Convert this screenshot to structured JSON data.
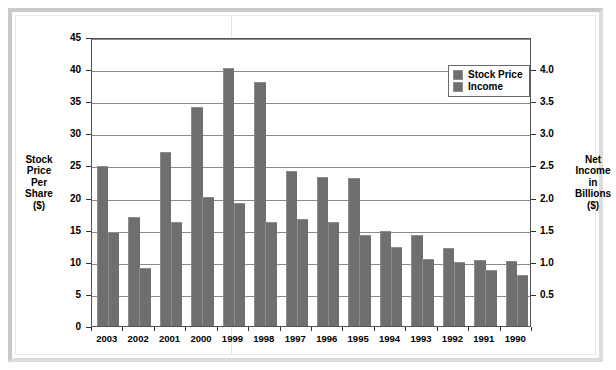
{
  "chart_data": {
    "type": "bar",
    "title": "",
    "categories": [
      "2003",
      "2002",
      "2001",
      "2000",
      "1999",
      "1998",
      "1997",
      "1996",
      "1995",
      "1994",
      "1993",
      "1992",
      "1991",
      "1990"
    ],
    "series": [
      {
        "name": "Stock Price",
        "axis": "left",
        "values": [
          24.7,
          16.8,
          26.9,
          33.9,
          40.0,
          37.8,
          24.0,
          23.0,
          22.9,
          14.7,
          14.0,
          12.0,
          10.1,
          9.9
        ]
      },
      {
        "name": "Income",
        "axis": "right",
        "values": [
          1.45,
          0.89,
          1.6,
          2.0,
          1.9,
          1.6,
          1.65,
          1.6,
          1.4,
          1.22,
          1.03,
          0.98,
          0.86,
          0.78
        ]
      }
    ],
    "left_axis": {
      "label": "Stock Price Per Share ($)",
      "label_lines": [
        "Stock",
        "Price",
        "Per",
        "Share",
        "($)"
      ],
      "ticks": [
        "0",
        "5",
        "10",
        "15",
        "20",
        "25",
        "30",
        "35",
        "40",
        "45"
      ],
      "min": 0,
      "max": 45,
      "step": 5
    },
    "right_axis": {
      "label": "Net Income in Billions ($)",
      "label_lines": [
        "Net",
        "Income",
        "in",
        "Billions",
        "($)"
      ],
      "ticks": [
        "0.5",
        "1.0",
        "1.5",
        "2.0",
        "2.5",
        "3.0",
        "3.5",
        "4.0"
      ],
      "min": 0,
      "max": 4.5,
      "step": 0.5
    },
    "legend": {
      "position": "top-right",
      "entries": [
        {
          "label": "Stock Price",
          "color": "#6f6f6f"
        },
        {
          "label": "Income",
          "color": "#6f6f6f"
        }
      ]
    },
    "grid": true,
    "colors": {
      "bar": "#6f6f6f",
      "grid": "#8a8a8a",
      "axis": "#555555",
      "frame": "#c9c9c9"
    }
  }
}
